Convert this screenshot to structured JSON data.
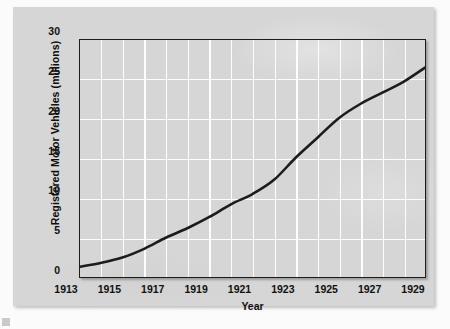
{
  "figure": {
    "panel_bg": "#d6d6d6",
    "page_bg": "#fbfbfb",
    "grid_color": "#fdfdfd",
    "line_color": "#1c1c1c",
    "axis_color": "#1c1c1c"
  },
  "chart_data": {
    "type": "line",
    "title": "",
    "subtitle": "",
    "xlabel": "Year",
    "ylabel": "Registered Motor Vehicles (millions)",
    "xlim": [
      1913,
      1929
    ],
    "ylim": [
      0,
      30
    ],
    "ytick_labels": [
      "0",
      "5",
      "10",
      "15",
      "20",
      "25",
      "30"
    ],
    "yticks": [
      0,
      5,
      10,
      15,
      20,
      25,
      30
    ],
    "xtick_labels": [
      "1913",
      "1915",
      "1917",
      "1919",
      "1921",
      "1923",
      "1925",
      "1927",
      "1929"
    ],
    "xticks": [
      1913,
      1915,
      1917,
      1919,
      1921,
      1923,
      1925,
      1927,
      1929
    ],
    "grid": "both-major-white",
    "legend": "none",
    "annotations": [],
    "x": [
      1913,
      1914,
      1915,
      1916,
      1917,
      1918,
      1919,
      1920,
      1921,
      1922,
      1923,
      1924,
      1925,
      1926,
      1927,
      1928,
      1929
    ],
    "values": [
      1.3,
      1.8,
      2.5,
      3.6,
      5.0,
      6.2,
      7.6,
      9.2,
      10.5,
      12.3,
      15.1,
      17.6,
      20.1,
      21.9,
      23.3,
      24.7,
      26.5
    ],
    "series": [
      {
        "name": "Registered Motor Vehicles",
        "values": [
          1.3,
          1.8,
          2.5,
          3.6,
          5.0,
          6.2,
          7.6,
          9.2,
          10.5,
          12.3,
          15.1,
          17.6,
          20.1,
          21.9,
          23.3,
          24.7,
          26.5
        ]
      }
    ]
  }
}
